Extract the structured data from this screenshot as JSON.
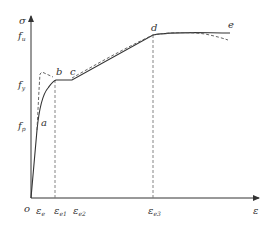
{
  "diagram": {
    "type": "stress-strain curve",
    "axes": {
      "y_label": "σ",
      "x_label": "ε",
      "origin_label": "o",
      "y_ticks": [
        {
          "base": "f",
          "sub": "u"
        },
        {
          "base": "f",
          "sub": "y"
        },
        {
          "base": "f",
          "sub": "p"
        }
      ],
      "x_ticks": [
        {
          "base": "ε",
          "sub": "e"
        },
        {
          "base": "ε",
          "sub": "e1"
        },
        {
          "base": "ε",
          "sub": "e2"
        },
        {
          "base": "ε",
          "sub": "e3"
        }
      ]
    },
    "points": [
      "a",
      "b",
      "c",
      "d",
      "e"
    ],
    "colors": {
      "line": "#333333",
      "dashed": "#555555",
      "background": "#ffffff"
    }
  }
}
